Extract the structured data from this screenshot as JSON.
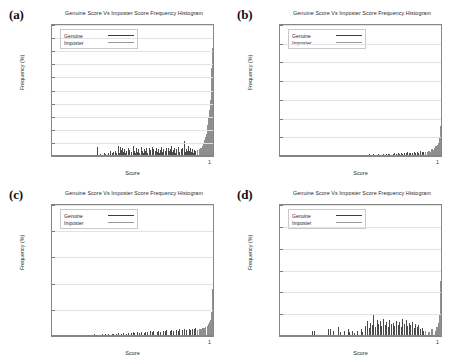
{
  "figure": {
    "panels": [
      {
        "tag": "(a)",
        "title": "Genuine Score Vs Imposter Score Frequency Histogram",
        "xlabel": "Score",
        "ylabel": "Frequency (%)",
        "x_tick_label": "1",
        "legend": {
          "genuine": "Genuine",
          "imposter": "Imposter"
        },
        "y_ticks": [
          "0",
          "2",
          "4",
          "6",
          "8",
          "10",
          "12",
          "14",
          "16",
          "18",
          "20"
        ]
      },
      {
        "tag": "(b)",
        "title": "Genuine Score Vs Imposter Score Frequency Histogram",
        "xlabel": "Score",
        "ylabel": "Frequency (%)",
        "x_tick_label": "1",
        "legend": {
          "genuine": "Genuine",
          "imposter": "Imposter"
        },
        "y_ticks": [
          "0",
          "5",
          "10",
          "15",
          "20",
          "25",
          "30",
          "35"
        ]
      },
      {
        "tag": "(c)",
        "title": "Genuine Score Vs Imposter Score Frequency Histogram",
        "xlabel": "Score",
        "ylabel": "Frequency (%)",
        "x_tick_label": "1",
        "legend": {
          "genuine": "Genuine",
          "imposter": "Imposter"
        },
        "y_ticks": [
          "0",
          "5",
          "10",
          "15",
          "20",
          "25"
        ]
      },
      {
        "tag": "(d)",
        "title": "Genuine Score Vs Imposter Score Frequency Histogram",
        "xlabel": "Score",
        "ylabel": "Frequency (%)",
        "x_tick_label": "1",
        "legend": {
          "genuine": "Genuine",
          "imposter": "Imposter"
        },
        "y_ticks": [
          "0",
          "2",
          "4",
          "6",
          "8",
          "10",
          "12"
        ]
      }
    ],
    "colors": {
      "genuine": "#4a4a4a",
      "imposter": "#8f8f8f",
      "frame": "#868686",
      "grid": "#e2e2e2",
      "background": "#ffffff"
    }
  },
  "chart_data": [
    {
      "type": "bar",
      "panel": "(a)",
      "title": "Genuine Score Vs Imposter Score Frequency Histogram",
      "xlabel": "Score",
      "ylabel": "Frequency (%)",
      "xlim": [
        0,
        1
      ],
      "ylim": [
        0,
        20
      ],
      "ytick_step": 2,
      "yticks": [
        0,
        2,
        4,
        6,
        8,
        10,
        12,
        14,
        16,
        18,
        20
      ],
      "xticks": [
        1
      ],
      "grid": true,
      "legend": [
        "Genuine",
        "Imposter"
      ],
      "legend_position": "upper-left",
      "series": [
        {
          "name": "Genuine",
          "x": [
            0.14,
            0.22,
            0.28,
            0.3,
            0.32,
            0.33,
            0.35,
            0.36,
            0.37,
            0.38,
            0.39,
            0.4,
            0.41,
            0.415,
            0.42,
            0.43,
            0.435,
            0.44,
            0.45,
            0.455,
            0.46,
            0.47,
            0.475,
            0.48,
            0.49,
            0.5,
            0.51,
            0.515,
            0.52,
            0.53,
            0.535,
            0.54,
            0.55,
            0.56,
            0.565,
            0.57,
            0.58,
            0.585,
            0.59,
            0.6,
            0.605,
            0.61,
            0.62,
            0.625,
            0.63,
            0.64,
            0.645,
            0.65,
            0.66,
            0.665,
            0.67,
            0.68,
            0.685,
            0.69,
            0.7,
            0.705,
            0.71,
            0.72,
            0.725,
            0.73,
            0.74,
            0.745,
            0.75,
            0.76,
            0.765,
            0.77,
            0.78,
            0.785,
            0.79,
            0.8,
            0.805,
            0.81,
            0.82,
            0.825,
            0.83,
            0.84,
            0.845,
            0.85,
            0.86,
            0.865,
            0.87,
            0.875,
            0.88,
            0.885,
            0.89
          ],
          "values": [
            0.2,
            0.2,
            1.4,
            0.3,
            0.4,
            0.3,
            0.5,
            0.7,
            0.4,
            0.6,
            0.8,
            0.5,
            1.5,
            0.4,
            1.4,
            0.9,
            1.3,
            0.6,
            1.0,
            0.5,
            0.8,
            1.2,
            0.4,
            0.9,
            0.6,
            1.5,
            0.8,
            0.4,
            1.3,
            0.6,
            1.0,
            0.5,
            1.4,
            0.8,
            0.5,
            1.1,
            0.7,
            1.3,
            0.5,
            1.2,
            0.6,
            0.9,
            1.4,
            0.5,
            1.0,
            0.7,
            1.3,
            0.6,
            1.1,
            0.5,
            0.9,
            1.4,
            0.6,
            1.0,
            0.8,
            1.3,
            0.5,
            1.2,
            0.7,
            1.0,
            1.5,
            0.6,
            0.9,
            1.3,
            0.5,
            1.1,
            0.8,
            1.4,
            0.6,
            1.0,
            0.7,
            1.2,
            2.3,
            0.6,
            1.1,
            0.8,
            1.5,
            0.7,
            1.3,
            0.6,
            1.0,
            0.5,
            0.9,
            0.4,
            0.7
          ]
        },
        {
          "name": "Imposter",
          "x": [
            0.9,
            0.91,
            0.92,
            0.93,
            0.94,
            0.945,
            0.95,
            0.955,
            0.96,
            0.965,
            0.97,
            0.975,
            0.98,
            0.985,
            0.99,
            0.995,
            1.0
          ],
          "values": [
            0.9,
            1.1,
            1.3,
            1.6,
            2.0,
            2.4,
            2.9,
            3.4,
            4.0,
            4.8,
            5.8,
            7.0,
            8.6,
            10.6,
            13.4,
            16.5,
            18.7
          ]
        }
      ],
      "notes": "Dominant spike at score ~1 reaching about 18.7%"
    },
    {
      "type": "bar",
      "panel": "(b)",
      "title": "Genuine Score Vs Imposter Score Frequency Histogram",
      "xlabel": "Score",
      "ylabel": "Frequency (%)",
      "xlim": [
        0,
        1
      ],
      "ylim": [
        0,
        35
      ],
      "ytick_step": 5,
      "yticks": [
        0,
        5,
        10,
        15,
        20,
        25,
        30,
        35
      ],
      "xticks": [
        1
      ],
      "grid": true,
      "legend": [
        "Genuine",
        "Imposter"
      ],
      "legend_position": "upper-left",
      "series": [
        {
          "name": "Genuine",
          "x": [
            0.12,
            0.2,
            0.26,
            0.32,
            0.36,
            0.4,
            0.43,
            0.45,
            0.47,
            0.49,
            0.5,
            0.52,
            0.54,
            0.55,
            0.57,
            0.58,
            0.6,
            0.61,
            0.63,
            0.64,
            0.66,
            0.67,
            0.68,
            0.7,
            0.71,
            0.72,
            0.73,
            0.74,
            0.75,
            0.76,
            0.77,
            0.78,
            0.79,
            0.8,
            0.81,
            0.82,
            0.83,
            0.84,
            0.85,
            0.86,
            0.87,
            0.88,
            0.89
          ],
          "values": [
            0.1,
            0.1,
            0.15,
            0.2,
            0.15,
            0.25,
            0.2,
            0.3,
            0.25,
            0.35,
            0.2,
            0.4,
            0.3,
            0.5,
            0.35,
            0.45,
            0.3,
            0.55,
            0.4,
            0.6,
            0.45,
            0.5,
            0.65,
            0.5,
            0.7,
            0.55,
            0.8,
            0.6,
            0.9,
            0.65,
            0.8,
            0.7,
            1.0,
            0.75,
            0.9,
            0.8,
            1.1,
            0.85,
            1.0,
            0.9,
            1.3,
            1.0,
            1.2
          ]
        },
        {
          "name": "Imposter",
          "x": [
            0.9,
            0.91,
            0.92,
            0.93,
            0.94,
            0.95,
            0.955,
            0.96,
            0.965,
            0.97,
            0.975,
            0.98,
            0.985,
            0.99,
            0.995,
            1.0
          ],
          "values": [
            1.1,
            1.0,
            1.4,
            1.2,
            1.8,
            1.5,
            2.2,
            1.9,
            2.6,
            2.3,
            3.0,
            3.4,
            4.2,
            5.0,
            8.0,
            16.5
          ]
        }
      ],
      "notes": "Spike at score ~1 reaching about 16.5%"
    },
    {
      "type": "bar",
      "panel": "(c)",
      "title": "Genuine Score Vs Imposter Score Frequency Histogram",
      "xlabel": "Score",
      "ylabel": "Frequency (%)",
      "xlim": [
        0,
        1
      ],
      "ylim": [
        0,
        25
      ],
      "ytick_step": 5,
      "yticks": [
        0,
        5,
        10,
        15,
        20,
        25
      ],
      "xticks": [
        1
      ],
      "grid": true,
      "legend": [
        "Genuine",
        "Imposter"
      ],
      "legend_position": "upper-left",
      "series": [
        {
          "name": "Genuine",
          "x": [
            0.13,
            0.18,
            0.23,
            0.26,
            0.29,
            0.31,
            0.33,
            0.35,
            0.37,
            0.38,
            0.4,
            0.41,
            0.43,
            0.44,
            0.46,
            0.47,
            0.49,
            0.5,
            0.51,
            0.53,
            0.54,
            0.55,
            0.57,
            0.58,
            0.59,
            0.61,
            0.62,
            0.63,
            0.65,
            0.66,
            0.67,
            0.69,
            0.7,
            0.71,
            0.73,
            0.74,
            0.75,
            0.77,
            0.78,
            0.79,
            0.81,
            0.82,
            0.83,
            0.85,
            0.86,
            0.87,
            0.88,
            0.89
          ],
          "values": [
            0.15,
            0.2,
            0.2,
            0.3,
            0.25,
            0.35,
            0.3,
            0.4,
            0.3,
            0.45,
            0.35,
            0.5,
            0.4,
            0.55,
            0.45,
            0.6,
            0.5,
            0.7,
            0.55,
            0.75,
            0.6,
            0.8,
            0.65,
            0.85,
            0.7,
            0.9,
            0.75,
            0.95,
            0.8,
            1.0,
            0.85,
            1.05,
            0.9,
            1.1,
            0.95,
            1.15,
            1.0,
            1.2,
            1.05,
            1.25,
            1.1,
            1.3,
            1.15,
            1.35,
            1.2,
            1.4,
            1.25,
            1.5
          ]
        },
        {
          "name": "Imposter",
          "x": [
            0.9,
            0.91,
            0.92,
            0.93,
            0.94,
            0.95,
            0.96,
            0.965,
            0.97,
            0.975,
            0.98,
            0.985,
            0.99,
            0.995,
            1.0
          ],
          "values": [
            1.2,
            1.4,
            1.3,
            1.6,
            1.5,
            1.8,
            2.0,
            1.9,
            2.3,
            2.6,
            3.0,
            3.6,
            4.6,
            9.0,
            20.0
          ]
        }
      ],
      "notes": "Spike at score ~1 reaching about 20%"
    },
    {
      "type": "bar",
      "panel": "(d)",
      "title": "Genuine Score Vs Imposter Score Frequency Histogram",
      "xlabel": "Score",
      "ylabel": "Frequency (%)",
      "xlim": [
        0,
        1
      ],
      "ylim": [
        0,
        12
      ],
      "ytick_step": 2,
      "yticks": [
        0,
        2,
        4,
        6,
        8,
        10,
        12
      ],
      "xticks": [
        1
      ],
      "grid": true,
      "legend": [
        "Genuine",
        "Imposter"
      ],
      "legend_position": "upper-left",
      "series": [
        {
          "name": "Genuine",
          "x": [
            0.2,
            0.21,
            0.3,
            0.31,
            0.33,
            0.36,
            0.37,
            0.4,
            0.42,
            0.43,
            0.45,
            0.46,
            0.48,
            0.5,
            0.51,
            0.53,
            0.54,
            0.55,
            0.56,
            0.57,
            0.58,
            0.59,
            0.6,
            0.61,
            0.62,
            0.63,
            0.64,
            0.65,
            0.66,
            0.67,
            0.68,
            0.69,
            0.7,
            0.71,
            0.72,
            0.73,
            0.74,
            0.75,
            0.76,
            0.77,
            0.78,
            0.79,
            0.8,
            0.81,
            0.82,
            0.83,
            0.84,
            0.85,
            0.86,
            0.87,
            0.88,
            0.89
          ],
          "values": [
            0.5,
            0.5,
            0.6,
            0.6,
            0.5,
            0.8,
            0.4,
            0.5,
            0.6,
            0.4,
            0.5,
            0.3,
            0.5,
            0.6,
            0.4,
            0.9,
            1.4,
            0.7,
            1.2,
            1.0,
            2.0,
            0.8,
            1.5,
            1.1,
            1.4,
            0.9,
            1.6,
            1.0,
            1.3,
            0.8,
            1.5,
            1.1,
            1.2,
            0.9,
            1.4,
            1.0,
            1.3,
            0.8,
            1.6,
            1.1,
            1.5,
            0.9,
            1.2,
            1.0,
            1.3,
            0.7,
            1.1,
            0.8,
            1.0,
            0.6,
            0.7,
            0.5
          ]
        },
        {
          "name": "Imposter",
          "x": [
            0.9,
            0.92,
            0.94,
            0.96,
            0.97,
            0.98,
            0.99,
            0.995,
            1.0
          ],
          "values": [
            0.5,
            0.4,
            0.6,
            0.5,
            0.8,
            1.2,
            2.0,
            5.0,
            11.7
          ]
        }
      ],
      "notes": "Spike at score ~1 reaching about 11.7%"
    }
  ]
}
